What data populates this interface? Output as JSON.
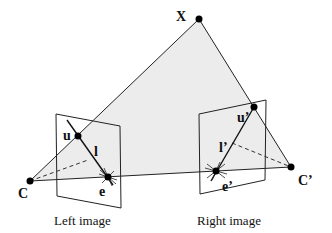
{
  "diagram": {
    "colors": {
      "plane_fill": "#ececec",
      "line": "#222222",
      "point": "#000000",
      "background": "#ffffff"
    },
    "points": {
      "X": {
        "label": "X",
        "x": 199,
        "y": 19
      },
      "C": {
        "label": "C",
        "x": 30,
        "y": 181
      },
      "Cp": {
        "label": "C’",
        "x": 291,
        "y": 167
      },
      "u": {
        "label": "u",
        "x": 78,
        "y": 136
      },
      "e": {
        "label": "e",
        "x": 108,
        "y": 177
      },
      "up": {
        "label": "u’",
        "x": 254,
        "y": 107
      },
      "ep": {
        "label": "e’",
        "x": 216,
        "y": 171
      }
    },
    "lines": {
      "l": {
        "label": "l"
      },
      "lp": {
        "label": "l’"
      }
    },
    "captions": {
      "left": "Left image",
      "right": "Right image"
    }
  }
}
